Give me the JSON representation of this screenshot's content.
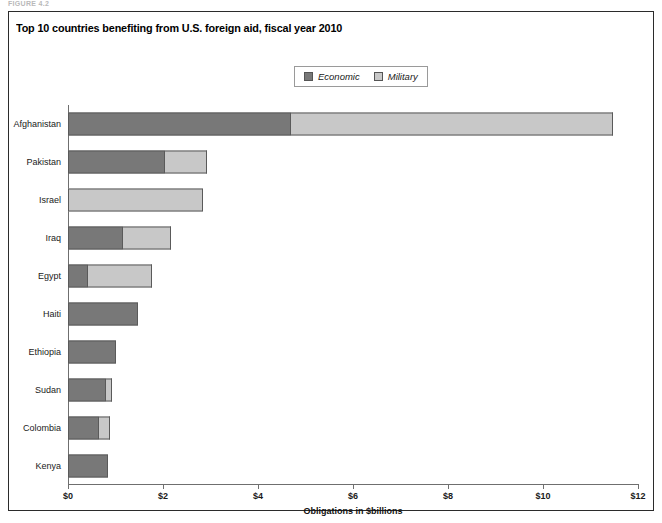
{
  "figure_label": "FIGURE 4.2",
  "chart_title": "Top 10 countries benefiting from U.S. foreign aid, fiscal year 2010",
  "legend": {
    "entries": [
      {
        "label": "Economic",
        "color": "#787878",
        "name": "legend-economic"
      },
      {
        "label": "Military",
        "color": "#c8c8c8",
        "name": "legend-military"
      }
    ]
  },
  "axis": {
    "x_title": "Obligations in $billions",
    "x_ticks": [
      "$0",
      "$2",
      "$4",
      "$6",
      "$8",
      "$10",
      "$12"
    ]
  },
  "chart_data": {
    "type": "bar",
    "orientation": "horizontal",
    "stacked": true,
    "title": "Top 10 countries benefiting from U.S. foreign aid, fiscal year 2010",
    "xlabel": "Obligations in $billions",
    "ylabel": "",
    "xlim": [
      0,
      12
    ],
    "xticks": [
      0,
      2,
      4,
      6,
      8,
      10,
      12
    ],
    "xtick_labels": [
      "$0",
      "$2",
      "$4",
      "$6",
      "$8",
      "$10",
      "$12"
    ],
    "grid": false,
    "legend_position": "top-center",
    "categories": [
      "Afghanistan",
      "Pakistan",
      "Israel",
      "Iraq",
      "Egypt",
      "Haiti",
      "Ethiopia",
      "Sudan",
      "Colombia",
      "Kenya"
    ],
    "series": [
      {
        "name": "Economic",
        "color": "#787878",
        "values": [
          4.7,
          2.05,
          0.0,
          1.15,
          0.42,
          1.47,
          1.01,
          0.8,
          0.65,
          0.84
        ]
      },
      {
        "name": "Military",
        "color": "#c8c8c8",
        "values": [
          6.77,
          0.88,
          2.84,
          1.02,
          1.35,
          0.0,
          0.0,
          0.13,
          0.23,
          0.0
        ]
      }
    ],
    "totals": [
      11.47,
      2.93,
      2.84,
      2.17,
      1.77,
      1.47,
      1.01,
      0.93,
      0.88,
      0.84
    ]
  }
}
